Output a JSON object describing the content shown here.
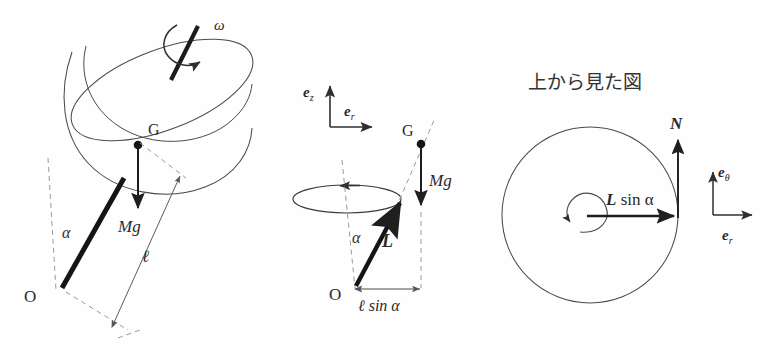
{
  "figure": {
    "title": "",
    "background_color": "#fefefe",
    "stroke_color": "#3a3a3a",
    "thin_stroke_color": "#555555",
    "dashed_color": "#8a8a8a",
    "text_color": "#2a2a2a"
  },
  "panels": [
    {
      "id": "left",
      "caption": "",
      "description": "spinning hemispherical bowl on a tilted rod pivoted at O",
      "labels": {
        "omega": "ω",
        "center_of_mass": "G",
        "weight": "Mg",
        "pivot": "O",
        "angle": "α",
        "length": "ℓ"
      }
    },
    {
      "id": "middle",
      "caption": "",
      "description": "side view with unit vectors, precession circle, rod L and weight Mg",
      "labels": {
        "e_z": "e",
        "e_z_sub": "z",
        "e_r": "e",
        "e_r_sub": "r",
        "center_of_mass": "G",
        "weight": "Mg",
        "rod": "L",
        "pivot": "O",
        "angle": "α",
        "radius": "ℓ sin α"
      }
    },
    {
      "id": "right",
      "caption": "上から見た図",
      "description": "top view: circular path, normal force N, radial arrow L sin alpha, unit vectors",
      "labels": {
        "normal_force": "N",
        "radius_vector": "L",
        "radius_vector_rest": " sin α",
        "e_theta": "e",
        "e_theta_sub": "θ",
        "e_r": "e",
        "e_r_sub": "r"
      }
    }
  ]
}
